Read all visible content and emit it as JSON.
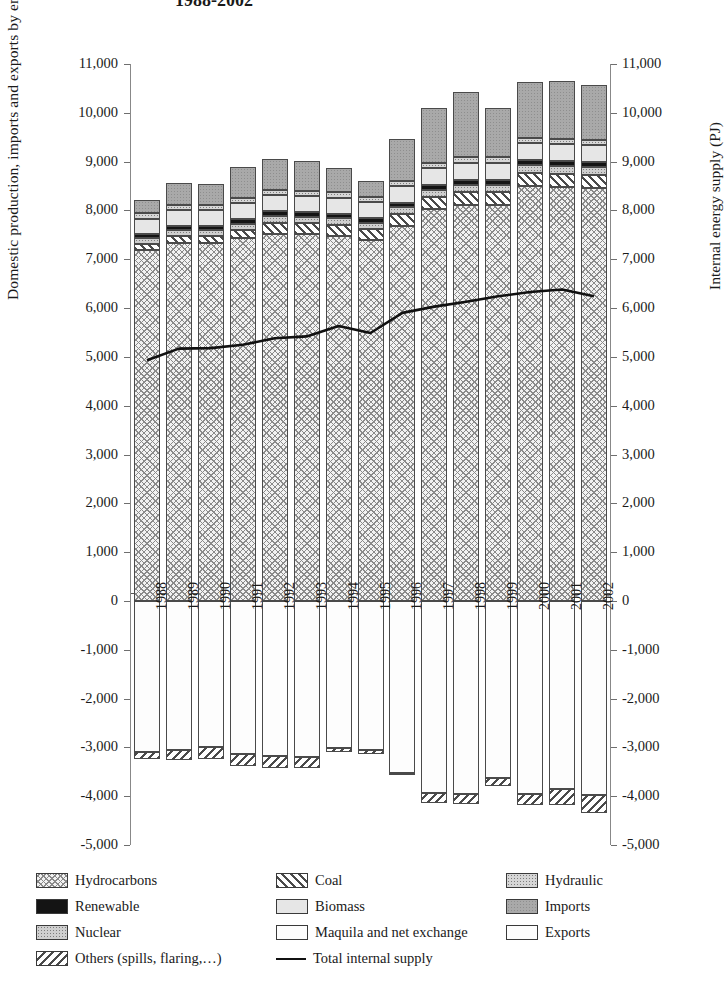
{
  "title": "1988-2002",
  "axes": {
    "left_label": "Domestic production, imports and exports by energy source (PJ)",
    "right_label": "Internal energy supply (PJ)",
    "tick_labels": [
      "11,000",
      "10,000",
      "9,000",
      "8,000",
      "7,000",
      "6,000",
      "5,000",
      "4,000",
      "3,000",
      "2,000",
      "1,000",
      "0",
      "-1,000",
      "-2,000",
      "-3,000",
      "-4,000",
      "-5,000"
    ]
  },
  "legend": {
    "rows": [
      [
        {
          "name": "hydrocarbons",
          "label": "Hydrocarbons",
          "pattern": "crosshatch-fine",
          "color": "#e9e9e9"
        },
        {
          "name": "coal",
          "label": "Coal",
          "pattern": "diagonal-stripe",
          "color": "#ffffff"
        },
        {
          "name": "hydraulic",
          "label": "Hydraulic",
          "pattern": "dotted",
          "color": "#d6d6d6"
        }
      ],
      [
        {
          "name": "renewable",
          "label": "Renewable",
          "pattern": "solid-dark",
          "color": "#141414"
        },
        {
          "name": "biomass",
          "label": "Biomass",
          "pattern": "light-solid",
          "color": "#e4e4e4"
        },
        {
          "name": "imports",
          "label": "Imports",
          "pattern": "mid-grey",
          "color": "#a9a9a9"
        }
      ],
      [
        {
          "name": "nuclear",
          "label": "Nuclear",
          "pattern": "dotted",
          "color": "#cfcfcf"
        },
        {
          "name": "maquila",
          "label": "Maquila and net exchange",
          "pattern": "white",
          "color": "#ffffff"
        },
        {
          "name": "exports",
          "label": "Exports",
          "pattern": "white",
          "color": "#fbfbfb"
        }
      ],
      [
        {
          "name": "others",
          "label": "Others (spills, flaring,…)",
          "pattern": "backslash-stripe",
          "color": "#ffffff"
        },
        {
          "name": "total-internal-supply",
          "label": "Total internal supply",
          "pattern": "line",
          "color": "#111111"
        }
      ]
    ]
  },
  "chart_data": {
    "type": "bar",
    "title": "1988-2002",
    "xlabel": "",
    "ylabel": "Domestic production, imports and exports by energy source (PJ)",
    "y2label": "Internal energy supply (PJ)",
    "ylim": [
      -5000,
      11000
    ],
    "grid": false,
    "legend_position": "bottom",
    "categories": [
      "1988",
      "1989",
      "1990",
      "1991",
      "1992",
      "1993",
      "1994",
      "1995",
      "1996",
      "1997",
      "1998",
      "1999",
      "2000",
      "2001",
      "2002"
    ],
    "stacked_positive": [
      {
        "name": "Hydrocarbons",
        "values": [
          7180,
          7330,
          7330,
          7440,
          7520,
          7510,
          7480,
          7390,
          7690,
          8020,
          8120,
          8120,
          8500,
          8480,
          8460
        ]
      },
      {
        "name": "Coal",
        "values": [
          140,
          150,
          150,
          160,
          230,
          230,
          230,
          230,
          240,
          250,
          260,
          260,
          270,
          270,
          270
        ]
      },
      {
        "name": "Nuclear",
        "values": [
          110,
          120,
          120,
          130,
          140,
          130,
          130,
          130,
          140,
          150,
          150,
          150,
          160,
          160,
          160
        ]
      },
      {
        "name": "Renewable",
        "values": [
          90,
          90,
          90,
          90,
          90,
          90,
          90,
          90,
          90,
          100,
          100,
          100,
          100,
          100,
          100
        ]
      },
      {
        "name": "Biomass",
        "values": [
          310,
          320,
          320,
          330,
          330,
          330,
          330,
          330,
          340,
          340,
          350,
          350,
          350,
          350,
          350
        ]
      },
      {
        "name": "Hydraulic",
        "values": [
          110,
          110,
          110,
          110,
          110,
          110,
          110,
          110,
          110,
          110,
          110,
          110,
          110,
          110,
          110
        ]
      },
      {
        "name": "Imports",
        "values": [
          280,
          450,
          430,
          620,
          630,
          620,
          490,
          330,
          850,
          1120,
          1330,
          1010,
          1140,
          1180,
          1120
        ]
      }
    ],
    "positive_totals": [
      8120,
      8320,
      8300,
      8680,
      8760,
      8750,
      8710,
      8490,
      9310,
      9960,
      10230,
      9960,
      10480,
      10530,
      10440
    ],
    "stacked_negative": [
      {
        "name": "Exports",
        "values": [
          -3100,
          -3050,
          -3000,
          -3130,
          -3170,
          -3200,
          -3010,
          -3050,
          -3520,
          -3940,
          -3960,
          -3620,
          -3950,
          -3850,
          -3980
        ]
      },
      {
        "name": "Others (spills, flaring,…)",
        "values": [
          -130,
          -200,
          -230,
          -250,
          -250,
          -230,
          -80,
          -80,
          -40,
          -200,
          -210,
          -170,
          -230,
          -330,
          -370
        ]
      }
    ],
    "negative_totals": [
      -3230,
      -3250,
      -3230,
      -3380,
      -3420,
      -3430,
      -3090,
      -3130,
      -3560,
      -4140,
      -4170,
      -3790,
      -4180,
      -4180,
      -4350
    ],
    "line_series": {
      "name": "Total internal supply",
      "values": [
        4930,
        5170,
        5180,
        5250,
        5380,
        5420,
        5630,
        5490,
        5900,
        6030,
        6130,
        6240,
        6330,
        6380,
        6240
      ]
    }
  }
}
